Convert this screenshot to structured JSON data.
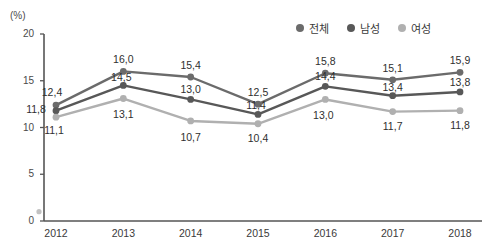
{
  "chart_data": {
    "type": "line",
    "title": "",
    "xlabel": "",
    "ylabel": "(%)",
    "unit_label": "(%)",
    "categories": [
      "2012",
      "2013",
      "2014",
      "2015",
      "2016",
      "2017",
      "2018"
    ],
    "ylim": [
      0,
      20
    ],
    "yticks": [
      "0",
      "5",
      "10",
      "15",
      "20"
    ],
    "ytick_values": [
      0,
      5,
      10,
      15,
      20
    ],
    "grid": false,
    "legend_position": "top-right",
    "decimal_separator": ",",
    "series": [
      {
        "name": "전체",
        "color": "#6b6b6b",
        "values": [
          12.4,
          16.0,
          15.4,
          12.5,
          15.8,
          15.1,
          15.9
        ],
        "labels": [
          "12,4",
          "16,0",
          "15,4",
          "12,5",
          "15,8",
          "15,1",
          "15,9"
        ]
      },
      {
        "name": "남성",
        "color": "#585858",
        "values": [
          11.8,
          14.5,
          13.0,
          11.4,
          14.4,
          13.4,
          13.8
        ],
        "labels": [
          "11,8",
          "14,5",
          "13,0",
          "11,4",
          "14,4",
          "13,4",
          "13,8"
        ]
      },
      {
        "name": "여성",
        "color": "#b0b0b0",
        "values": [
          11.1,
          13.1,
          10.7,
          10.4,
          13.0,
          11.7,
          11.8
        ],
        "labels": [
          "11,1",
          "13,1",
          "10,7",
          "10,4",
          "13,0",
          "11,7",
          "11,8"
        ]
      }
    ]
  },
  "axis": {
    "color": "#555555"
  }
}
